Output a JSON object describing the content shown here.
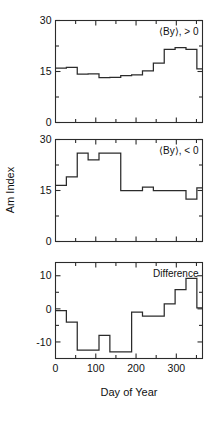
{
  "figure": {
    "x_axis_title": "Day of Year",
    "y_axis_title": "Am Index"
  },
  "chart_data": [
    {
      "type": "line",
      "subtype": "step",
      "title": "",
      "annotation": "⟨By⟩, > 0",
      "xlabel": "",
      "ylabel": "Am Index",
      "xlim": [
        0,
        365
      ],
      "ylim": [
        0,
        30
      ],
      "xticks": [
        0,
        100,
        200,
        300
      ],
      "xtick_labels": [
        "0",
        "100",
        "200",
        "300"
      ],
      "xminor_ticks": [
        50,
        150,
        250,
        350
      ],
      "yticks": [
        0,
        15,
        30
      ],
      "ytick_labels": [
        "0",
        "15",
        "30"
      ],
      "yminor_ticks": [
        7.5,
        22.5
      ],
      "grid": false,
      "legend": "none",
      "bin_edges": [
        0,
        27,
        54,
        81,
        108,
        135,
        162,
        189,
        216,
        243,
        270,
        297,
        324,
        351,
        365
      ],
      "x": [
        13,
        40,
        67,
        94,
        121,
        148,
        175,
        202,
        229,
        256,
        283,
        310,
        337,
        358
      ],
      "values": [
        16,
        16.2,
        14.2,
        14.3,
        13.2,
        13.3,
        13.8,
        14.0,
        15.2,
        17.5,
        21.5,
        22.0,
        21.5,
        15.8
      ]
    },
    {
      "type": "line",
      "subtype": "step",
      "title": "",
      "annotation": "⟨By⟩, < 0",
      "xlabel": "",
      "ylabel": "Am Index",
      "xlim": [
        0,
        365
      ],
      "ylim": [
        0,
        30
      ],
      "xticks": [
        0,
        100,
        200,
        300
      ],
      "xtick_labels": [
        "0",
        "100",
        "200",
        "300"
      ],
      "xminor_ticks": [
        50,
        150,
        250,
        350
      ],
      "yticks": [
        0,
        15,
        30
      ],
      "ytick_labels": [
        "0",
        "15",
        "30"
      ],
      "yminor_ticks": [
        7.5,
        22.5
      ],
      "grid": false,
      "legend": "none",
      "bin_edges": [
        0,
        27,
        54,
        81,
        108,
        135,
        162,
        189,
        216,
        243,
        270,
        297,
        324,
        351,
        365
      ],
      "x": [
        13,
        40,
        67,
        94,
        121,
        148,
        175,
        202,
        229,
        256,
        283,
        310,
        337,
        358
      ],
      "values": [
        16.5,
        19.0,
        26.0,
        24.0,
        26.0,
        26.0,
        15.0,
        15.0,
        16.0,
        15.0,
        15.0,
        15.0,
        12.5,
        15.8
      ]
    },
    {
      "type": "line",
      "subtype": "step",
      "title": "",
      "annotation": "Difference",
      "xlabel": "Day of Year",
      "ylabel": "",
      "xlim": [
        0,
        365
      ],
      "ylim": [
        -15,
        14
      ],
      "xticks": [
        0,
        100,
        200,
        300
      ],
      "xtick_labels": [
        "0",
        "100",
        "200",
        "300"
      ],
      "xminor_ticks": [
        50,
        150,
        250,
        350
      ],
      "yticks": [
        -10,
        0,
        10
      ],
      "ytick_labels": [
        "-10",
        "0",
        "10"
      ],
      "yminor_ticks": [
        -5,
        5
      ],
      "grid": false,
      "legend": "none",
      "bin_edges": [
        0,
        27,
        54,
        81,
        108,
        135,
        162,
        189,
        216,
        243,
        270,
        297,
        324,
        351,
        365
      ],
      "x": [
        13,
        40,
        67,
        94,
        121,
        148,
        175,
        202,
        229,
        256,
        283,
        310,
        337,
        358
      ],
      "values": [
        -0.5,
        -4.0,
        -12.5,
        -12.5,
        -8.0,
        -13.0,
        -13.0,
        -1.0,
        -2.2,
        -2.2,
        1.5,
        5.8,
        9.2,
        0.3
      ]
    }
  ]
}
